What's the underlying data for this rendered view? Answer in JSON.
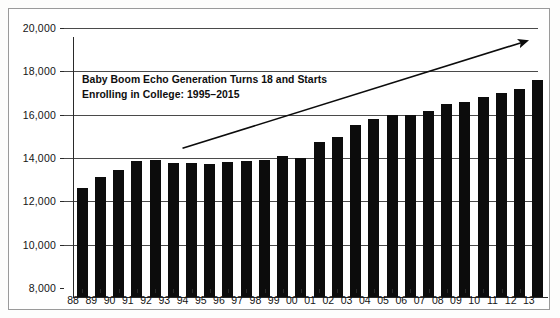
{
  "chart_data": {
    "type": "bar",
    "title": "",
    "xlabel": "",
    "ylabel": "",
    "grid": true,
    "legend": "none",
    "ylim": [
      8000,
      20000
    ],
    "ytick_values": [
      20000,
      18000,
      16000,
      14000,
      12000,
      10000,
      8000
    ],
    "ytick_labels": [
      "20,000",
      "18,000",
      "16,000",
      "14,000",
      "12,000",
      "10,000",
      "8,000"
    ],
    "categories": [
      "88",
      "89",
      "90",
      "91",
      "92",
      "93",
      "94",
      "95",
      "96",
      "97",
      "98",
      "99",
      "00",
      "01",
      "02",
      "03",
      "04",
      "05",
      "06",
      "07",
      "08",
      "09",
      "10",
      "11",
      "12",
      "13"
    ],
    "values": [
      13050,
      13560,
      13840,
      14280,
      14330,
      14200,
      14200,
      14120,
      14250,
      14280,
      14320,
      14500,
      14420,
      15150,
      15400,
      15950,
      16200,
      16380,
      16400,
      16600,
      16900,
      17000,
      17250,
      17400,
      17600,
      18000
    ],
    "annotations": [
      {
        "name": "trend-arrow",
        "kind": "arrow",
        "from_category": "94",
        "to_category": "13",
        "from_value": 14450,
        "to_value": 19450
      }
    ],
    "text_annotations": [
      "Baby Boom Echo Generation Turns 18 and Starts",
      "Enrolling in College: 1995–2015"
    ],
    "colors": {
      "bar": "#0c0c0c",
      "gridline": "#4a4a4a",
      "axis": "#2a2a2a",
      "text": "#141414",
      "frame": "#9a9a9a",
      "background": "#ffffff"
    }
  }
}
